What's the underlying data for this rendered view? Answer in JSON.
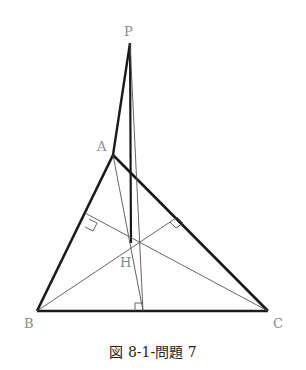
{
  "figure": {
    "caption": "図 8-1-問題 7",
    "points": {
      "P": {
        "label": "P",
        "x": 130,
        "y": 43
      },
      "A": {
        "label": "A",
        "x": 113,
        "y": 155
      },
      "B": {
        "label": "B",
        "x": 37,
        "y": 311
      },
      "C": {
        "label": "C",
        "x": 268,
        "y": 311
      },
      "H": {
        "label": "H",
        "x": 131,
        "y": 243
      }
    },
    "colors": {
      "thick": "#1a1a1a",
      "thin": "#555555",
      "label": "#8a8a8a"
    }
  }
}
